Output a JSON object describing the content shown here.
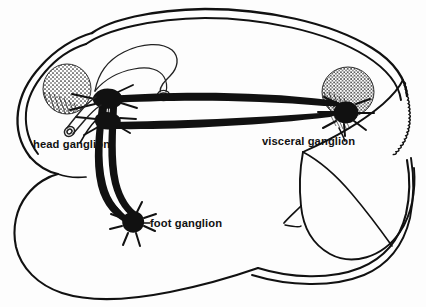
{
  "figure": {
    "background_color": "#fdfdfd",
    "ink_color": "#111111",
    "width": 426,
    "height": 307
  },
  "labels": {
    "head_ganglion": "head ganglion",
    "visceral_ganglion": "visceral ganglion",
    "foot_ganglion": "foot ganglion"
  },
  "anatomy": {
    "body_outline_name": "mollusc body outline",
    "mantle_edge_name": "serrated mantle edge",
    "gut_loop_name": "gut loop",
    "stipple_left_name": "left stippled organ",
    "stipple_right_name": "right stippled organ",
    "connective_upper_name": "upper nerve connective",
    "connective_lower_name": "lower nerve connective",
    "pedal_cord_name": "pedal nerve cords"
  },
  "diagram_data": {
    "type": "anatomical-line-drawing",
    "ganglia": [
      {
        "name": "head ganglion",
        "label": "head ganglion",
        "label_x": 33,
        "label_y": 148,
        "marker_x": 108,
        "marker_y": 100,
        "shape": "dark-lobed-mass"
      },
      {
        "name": "visceral ganglion",
        "label": "visceral ganglion",
        "label_x": 262,
        "label_y": 145,
        "marker_x": 348,
        "marker_y": 113,
        "shape": "dark-star-mass"
      },
      {
        "name": "foot ganglion",
        "label": "foot ganglion",
        "label_x": 143,
        "label_y": 227,
        "marker_x": 133,
        "marker_y": 222,
        "shape": "dark-star-mass"
      }
    ],
    "connectives": [
      {
        "from": "head ganglion",
        "to": "visceral ganglion",
        "style": "thick-upper-arc"
      },
      {
        "from": "head ganglion",
        "to": "visceral ganglion",
        "style": "thick-lower-arc"
      },
      {
        "from": "head ganglion",
        "to": "foot ganglion",
        "style": "thick-paired-cord"
      }
    ],
    "stippled_organs": [
      {
        "name": "left stippled organ",
        "cx": 67,
        "cy": 89,
        "rx": 24,
        "ry": 25
      },
      {
        "name": "right stippled organ",
        "cx": 348,
        "cy": 92,
        "rx": 26,
        "ry": 25
      }
    ]
  }
}
